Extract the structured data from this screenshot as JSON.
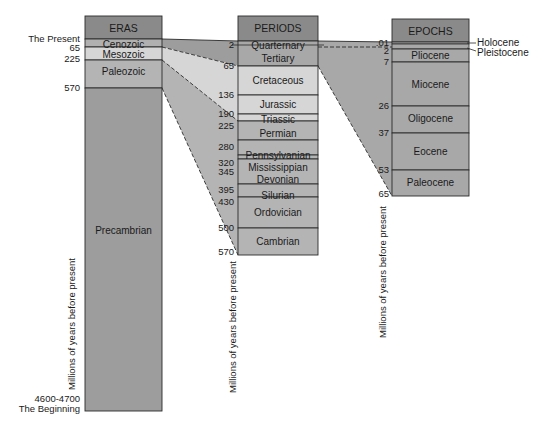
{
  "colors": {
    "header": "#8a8a8a",
    "dark": "#9d9d9d",
    "mid": "#b4b4b4",
    "light": "#d6d6d6",
    "line": "#2a2a2a"
  },
  "eras": {
    "header": "ERAS",
    "left_labels": {
      "present": "The Present",
      "beginning_value": "4600-4700",
      "beginning": "The Beginning"
    },
    "items": [
      {
        "name": "Cenozoic",
        "start": "65"
      },
      {
        "name": "Mesozoic",
        "start": "225"
      },
      {
        "name": "Paleozoic",
        "start": "570"
      },
      {
        "name": "Precambrian",
        "start": "4600-4700"
      }
    ],
    "axis_label": "Millions of years before present"
  },
  "periods": {
    "header": "PERIODS",
    "items": [
      {
        "name": "Quarternary",
        "start": "2"
      },
      {
        "name": "Tertiary",
        "start": "65"
      },
      {
        "name": "Cretaceous",
        "start": "136"
      },
      {
        "name": "Jurassic",
        "start": "190"
      },
      {
        "name": "Triassic",
        "start": "225"
      },
      {
        "name": "Permian",
        "start": "280"
      },
      {
        "name": "Pennsylvanian",
        "start": "320"
      },
      {
        "name": "Mississippian",
        "start": "345"
      },
      {
        "name": "Devonian",
        "start": "395"
      },
      {
        "name": "Silurian",
        "start": "430"
      },
      {
        "name": "Ordovician",
        "start": "500"
      },
      {
        "name": "Cambrian",
        "start": "570"
      }
    ],
    "axis_label": "Millions of years before present"
  },
  "epochs": {
    "header": "EPOCHS",
    "items": [
      {
        "name": "Holocene",
        "start": ".01"
      },
      {
        "name": "Pleistocene",
        "start": "2"
      },
      {
        "name": "Pliocene",
        "start": "7"
      },
      {
        "name": "Miocene",
        "start": "26"
      },
      {
        "name": "Oligocene",
        "start": "37"
      },
      {
        "name": "Eocene",
        "start": "53"
      },
      {
        "name": "Paleocene",
        "start": "65"
      }
    ],
    "axis_label": "Millions of years before present"
  }
}
